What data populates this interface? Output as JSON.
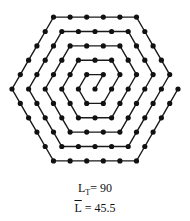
{
  "diagram": {
    "type": "hexagonal-spiral-path",
    "center": [
      95,
      89
    ],
    "step_px": 16.6,
    "arm_lengths": [
      1,
      1,
      2,
      2,
      3,
      3,
      4,
      4,
      5,
      5,
      5,
      5,
      5,
      5,
      5,
      5,
      5,
      5
    ],
    "line_color": "#1a1a1a",
    "dot_color": "#111111"
  },
  "labels": {
    "total_length_symbol": "L",
    "total_length_sub": "T",
    "total_length_value": "= 90",
    "mean_length_symbol": "L",
    "mean_length_value": "= 45.5"
  }
}
